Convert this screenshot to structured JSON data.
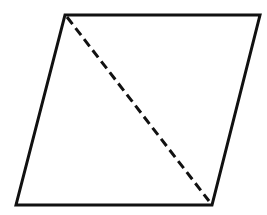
{
  "diagram": {
    "type": "geometry",
    "shape": "parallelogram",
    "stroke_color": "#111111",
    "background": "#ffffff",
    "stroke_width": 3,
    "vertices": {
      "top_left": [
        65,
        15
      ],
      "top_right": [
        260,
        15
      ],
      "bottom_right": [
        212,
        205
      ],
      "bottom_left": [
        16,
        205
      ]
    },
    "diagonal": {
      "style": "dashed",
      "from": [
        67,
        17
      ],
      "to": [
        209,
        201
      ],
      "dash": "9 5"
    }
  }
}
